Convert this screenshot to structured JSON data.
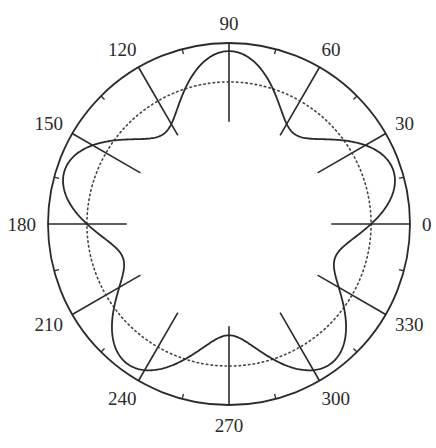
{
  "chart_data": {
    "type": "line",
    "subtype": "polar",
    "title": "",
    "angle_unit": "degrees",
    "angular_tick_labels": [
      "0",
      "30",
      "60",
      "90",
      "120",
      "150",
      "180",
      "210",
      "240",
      "270",
      "300",
      "330"
    ],
    "angular_ticks": [
      0,
      30,
      60,
      90,
      120,
      150,
      180,
      210,
      240,
      270,
      300,
      330
    ],
    "minor_angular_ticks": [
      15,
      45,
      75,
      105,
      135,
      165,
      195,
      225,
      255,
      285,
      315,
      345
    ],
    "radial_range": [
      0,
      1
    ],
    "reference_circle": {
      "r": 0.785,
      "style": "dotted"
    },
    "spoke_inner_radius": 0.565,
    "series": [
      {
        "name": "r(theta)",
        "function": "r = 0.785 + 0.17*cos(5*(theta - 90deg))",
        "symmetry": "5-fold",
        "peaks_deg": [
          18,
          90,
          162,
          234,
          306
        ],
        "troughs_deg": [
          54,
          126,
          198,
          270,
          342
        ],
        "r_max": 0.955,
        "r_min": 0.615,
        "base": 0.785,
        "amplitude": 0.17,
        "harmonic": 5,
        "phase_deg": 90,
        "style": "solid"
      }
    ],
    "legend": "none",
    "grid": true
  }
}
